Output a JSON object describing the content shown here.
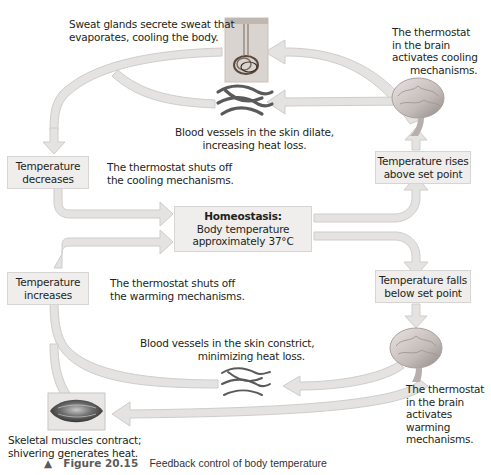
{
  "colors": {
    "arrow_fill": "#e4e3e2",
    "arrow_stroke": "#cfcdcc",
    "box_fill": "#efeeed",
    "box_border": "#d7d5d4",
    "text": "#231f20",
    "brain": "#c9c4c2",
    "vessel": "#5a5a5a"
  },
  "labels": {
    "sweat": [
      "Sweat glands secrete sweat that",
      "evaporates, cooling the body."
    ],
    "thermostat_cooling": [
      "The thermostat",
      "in the brain",
      "activates cooling",
      "mechanisms."
    ],
    "dilate": [
      "Blood vessels in the skin dilate,",
      "increasing heat loss."
    ],
    "shuts_off_cooling": [
      "The thermostat shuts off",
      "the cooling mechanisms."
    ],
    "shuts_off_warming": [
      "The thermostat shuts off",
      "the warming mechanisms."
    ],
    "constrict": [
      "Blood vessels in the skin constrict,",
      "minimizing heat loss."
    ],
    "muscles": [
      "Skeletal muscles contract;",
      "shivering generates heat."
    ],
    "thermostat_warming": [
      "The thermostat",
      "in the brain",
      "activates",
      "warming",
      "mechanisms."
    ]
  },
  "boxes": {
    "temp_decreases": [
      "Temperature",
      "decreases"
    ],
    "temp_increases": [
      "Temperature",
      "increases"
    ],
    "temp_rises": [
      "Temperature rises",
      "above set point"
    ],
    "temp_falls": [
      "Temperature falls",
      "below set point"
    ],
    "homeostasis": {
      "title": "Homeostasis:",
      "line1": "Body temperature",
      "line2": "approximately 37°C"
    }
  },
  "caption": {
    "marker": "▲",
    "figure": "Figure 20.15",
    "description": "Feedback control of body temperature"
  },
  "icons": {
    "sweat_gland": "sweat-gland-illustration",
    "vessels_dilated": "blood-vessels-dilated-illustration",
    "vessels_constricted": "blood-vessels-constricted-illustration",
    "brain_top": "brain-illustration",
    "brain_bottom": "brain-illustration",
    "muscle": "skeletal-muscle-illustration"
  }
}
